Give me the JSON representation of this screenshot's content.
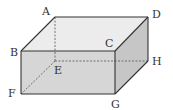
{
  "diagram": {
    "type": "cuboid",
    "vertices": {
      "A": {
        "x": 55,
        "y": 17
      },
      "B": {
        "x": 21,
        "y": 51
      },
      "C": {
        "x": 115,
        "y": 51
      },
      "D": {
        "x": 148,
        "y": 17
      },
      "E": {
        "x": 55,
        "y": 61
      },
      "F": {
        "x": 21,
        "y": 94
      },
      "G": {
        "x": 115,
        "y": 94
      },
      "H": {
        "x": 148,
        "y": 61
      }
    },
    "labels": [
      {
        "id": "A",
        "text": "A",
        "x": 42,
        "y": 15
      },
      {
        "id": "B",
        "text": "B",
        "x": 10,
        "y": 56
      },
      {
        "id": "C",
        "text": "C",
        "x": 105,
        "y": 47
      },
      {
        "id": "D",
        "text": "D",
        "x": 152,
        "y": 18
      },
      {
        "id": "E",
        "text": "E",
        "x": 54,
        "y": 74
      },
      {
        "id": "F",
        "text": "F",
        "x": 8,
        "y": 97
      },
      {
        "id": "G",
        "text": "G",
        "x": 111,
        "y": 108
      },
      {
        "id": "H",
        "text": "H",
        "x": 152,
        "y": 65
      }
    ],
    "hidden_edges": [
      "AE",
      "EF",
      "EH"
    ],
    "colors": {
      "top_face": "#ececec",
      "front_face": "#d6d6d6",
      "right_face": "#c6c6c6",
      "edge": "#333333",
      "hidden_edge": "#555555"
    }
  }
}
